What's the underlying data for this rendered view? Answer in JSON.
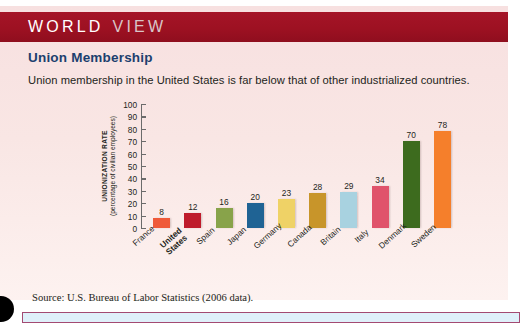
{
  "banner": {
    "word_1": "WORLD",
    "word_2": "VIEW",
    "color": "#9d1122"
  },
  "heading": "Union Membership",
  "subheading": "Union membership in the United States is far below that of other industrialized countries.",
  "source": "Source: U.S. Bureau of Labor Statistics (2006 data).",
  "chart_data": {
    "type": "bar",
    "title": "Union Membership",
    "subtitle": "Union membership in the United States is far below that of other industrialized countries.",
    "xlabel": "",
    "ylabel": "UNIONIZATION RATE",
    "ylabel_sub": "(percentage of civilian employees)",
    "ylim": [
      0,
      100
    ],
    "yticks": [
      100,
      90,
      80,
      70,
      60,
      50,
      40,
      30,
      20,
      10,
      0
    ],
    "grid": false,
    "legend": "none",
    "categories": [
      "France",
      "United States",
      "Spain",
      "Japan",
      "Germany",
      "Canada",
      "Britain",
      "Italy",
      "Denmark",
      "Sweden"
    ],
    "values": [
      8,
      12,
      16,
      20,
      23,
      28,
      29,
      34,
      70,
      78
    ],
    "colors": [
      "#ef5a3a",
      "#bf1b2c",
      "#88a34a",
      "#1f6394",
      "#efd266",
      "#c8952a",
      "#a8d2e0",
      "#e0536b",
      "#3d6b1e",
      "#f57f2b"
    ],
    "highlight_category": "United States"
  },
  "bottom_strip": {
    "fill": "#dff0fa",
    "border": "#a34a72"
  }
}
